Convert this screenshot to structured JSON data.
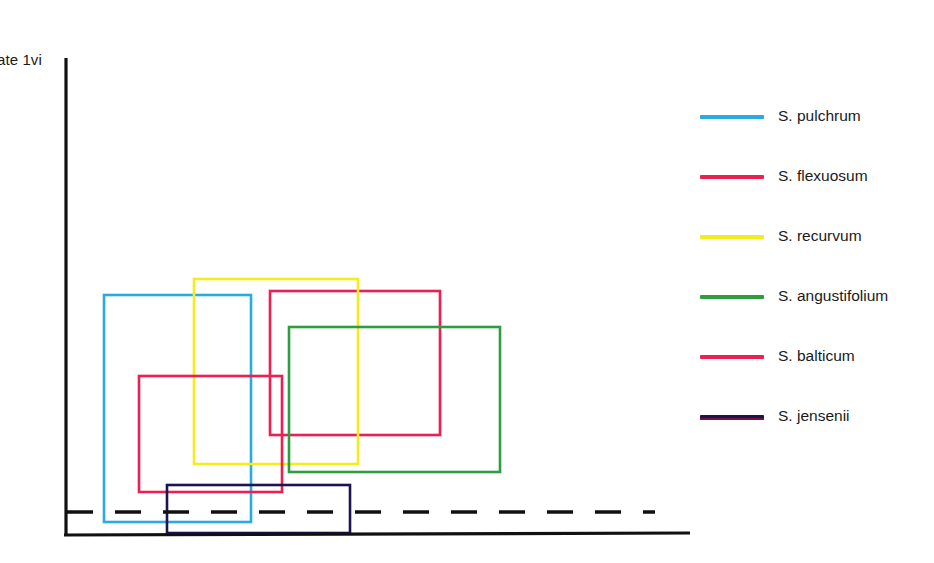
{
  "figure": {
    "axis_label_y": "ate 1vi",
    "background": "#ffffff",
    "axis_color": "#111111"
  },
  "legend": {
    "items": [
      {
        "label": "S. pulchrum",
        "color": "#29ABE2"
      },
      {
        "label": "S. flexuosum",
        "color": "#ED1E51"
      },
      {
        "label": "S. recurvum",
        "color": "#F5EC1B"
      },
      {
        "label": "S. angustifolium",
        "color": "#2E9D3E"
      },
      {
        "label": "S. balticum",
        "color": "#ED1E51"
      },
      {
        "label": "S. jensenii",
        "color": "#1C1450"
      }
    ]
  },
  "chart_data": {
    "type": "scatter",
    "title": "",
    "xlabel": "",
    "ylabel": "ate 1vi",
    "grid": false,
    "legend_position": "right",
    "annotation": "Species niche envelopes drawn as overlapping rectangles (convex hulls) in ordination space; dashed horizontal reference line near the base of the plot.",
    "axes": {
      "y_axis": {
        "x": 66,
        "y_top": 58,
        "y_bottom": 535
      },
      "x_axis": {
        "y_left": 535,
        "y_right": 533,
        "x_left": 64,
        "x_right": 690
      },
      "reference_line": {
        "style": "dashed",
        "y": 512,
        "x_start": 67,
        "x_end": 655
      }
    },
    "series": [
      {
        "name": "S. pulchrum",
        "color": "#29ABE2",
        "shape": "rect",
        "x1": 104,
        "y1": 295,
        "x2": 251,
        "y2": 522
      },
      {
        "name": "S. flexuosum",
        "color": "#ED1E51",
        "shape": "rect",
        "x1": 270,
        "y1": 291,
        "x2": 440,
        "y2": 435
      },
      {
        "name": "S. recurvum",
        "color": "#F5EC1B",
        "shape": "rect",
        "x1": 194,
        "y1": 279,
        "x2": 358,
        "y2": 464
      },
      {
        "name": "S. angustifolium",
        "color": "#2E9D3E",
        "shape": "rect",
        "x1": 289,
        "y1": 327,
        "x2": 500,
        "y2": 472
      },
      {
        "name": "S. balticum",
        "color": "#ED1E51",
        "shape": "rect",
        "x1": 139,
        "y1": 376,
        "x2": 282,
        "y2": 492
      },
      {
        "name": "S. jensenii",
        "color": "#1C1450",
        "shape": "rect",
        "x1": 167,
        "y1": 485,
        "x2": 350,
        "y2": 533
      }
    ]
  }
}
